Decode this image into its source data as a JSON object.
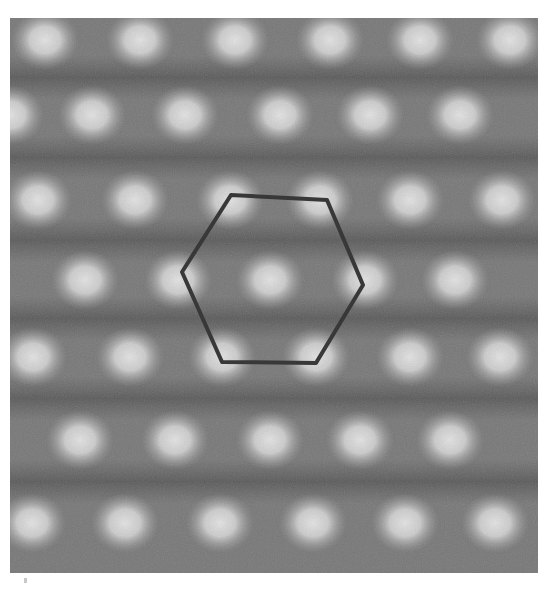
{
  "figure": {
    "kind": "atomic-resolution micrograph",
    "frame": {
      "x": 10,
      "y": 18,
      "width": 528,
      "height": 555
    },
    "colors": {
      "page_background": "#ffffff",
      "image_background": "#777777",
      "dark_band": "#585858",
      "bright_spot": "#dcdcdc",
      "overlay_stroke": "#383838"
    },
    "lattice_rows": [
      {
        "y": 40,
        "spots_x": [
          45,
          140,
          235,
          330,
          420,
          510
        ]
      },
      {
        "y": 115,
        "spots_x": [
          10,
          92,
          185,
          280,
          370,
          460
        ]
      },
      {
        "y": 200,
        "spots_x": [
          38,
          135,
          230,
          320,
          410,
          502
        ]
      },
      {
        "y": 280,
        "spots_x": [
          85,
          178,
          270,
          365,
          455
        ]
      },
      {
        "y": 357,
        "spots_x": [
          33,
          130,
          222,
          316,
          410,
          500
        ]
      },
      {
        "y": 440,
        "spots_x": [
          80,
          175,
          270,
          360,
          450
        ]
      },
      {
        "y": 523,
        "spots_x": [
          32,
          125,
          220,
          313,
          405,
          495
        ]
      }
    ],
    "overlay": {
      "shape": "hexagon",
      "stroke_width": 4,
      "vertices": [
        [
          231,
          195
        ],
        [
          327,
          200
        ],
        [
          363,
          285
        ],
        [
          316,
          363
        ],
        [
          222,
          362
        ],
        [
          182,
          272
        ]
      ]
    }
  }
}
